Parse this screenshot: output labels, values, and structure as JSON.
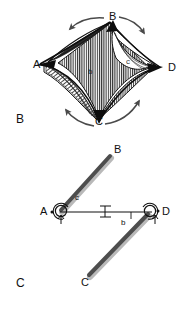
{
  "figure": {
    "panels": [
      {
        "id": "panel-b",
        "label": "B",
        "description": "Three-dimensional hatched saddle surface spanning four vertices with curved rotation arrows",
        "vertices": [
          {
            "name": "A",
            "label": "A",
            "x": 38,
            "y": 66
          },
          {
            "name": "B",
            "label": "B",
            "x": 113,
            "y": 19
          },
          {
            "name": "C",
            "label": "C",
            "x": 99,
            "y": 122
          },
          {
            "name": "D",
            "label": "D",
            "x": 172,
            "y": 69
          }
        ],
        "inner_labels": [
          {
            "name": "b",
            "label": "b",
            "x": 91,
            "y": 73
          },
          {
            "name": "c",
            "label": "c",
            "x": 129,
            "y": 63
          }
        ],
        "arrows": [
          {
            "name": "arrow-top-left",
            "direction": "counter-clockwise"
          },
          {
            "name": "arrow-top-right",
            "direction": "clockwise"
          },
          {
            "name": "arrow-bottom-left",
            "direction": "counter-clockwise"
          },
          {
            "name": "arrow-bottom-right",
            "direction": "clockwise"
          }
        ]
      },
      {
        "id": "panel-c",
        "label": "C",
        "description": "Simplified two-dimensional rod-and-angle schematic",
        "vertices": [
          {
            "name": "A",
            "label": "A",
            "x": 45,
            "y": 213
          },
          {
            "name": "B",
            "label": "B",
            "x": 117,
            "y": 151
          },
          {
            "name": "C",
            "label": "C",
            "x": 84,
            "y": 283
          },
          {
            "name": "D",
            "label": "D",
            "x": 164,
            "y": 213
          }
        ],
        "angle_labels": [
          {
            "name": "c",
            "label": "c",
            "x": 78,
            "y": 199
          },
          {
            "name": "b",
            "label": "b",
            "x": 124,
            "y": 224
          }
        ],
        "markers": [
          {
            "name": "length-marker",
            "label": ""
          }
        ]
      }
    ],
    "colors": {
      "ink": "#111111",
      "hatch": "#2b2b2b",
      "rod_fill": "#555555",
      "rod_shadow": "#b8b8b8",
      "arrow": "#4a4a4a",
      "background": "#ffffff"
    }
  }
}
